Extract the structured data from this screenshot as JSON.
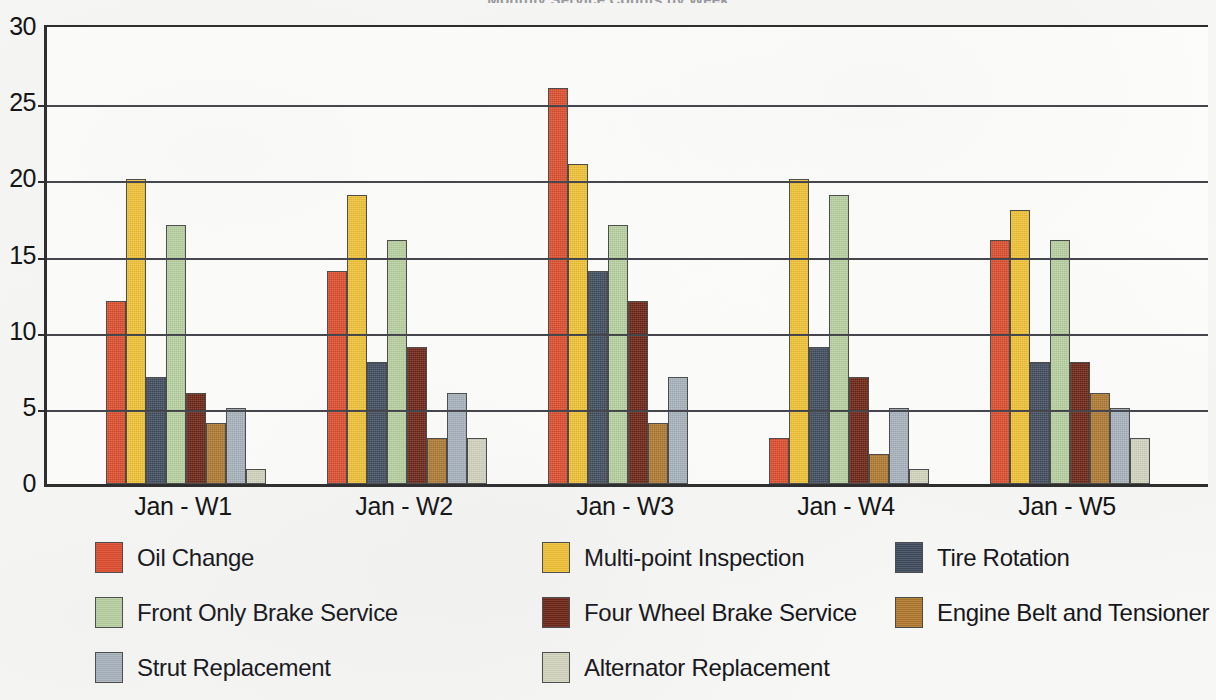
{
  "chart_data": {
    "type": "bar",
    "title": "Monthly Service Counts by Week",
    "xlabel": "",
    "ylabel": "",
    "ylim": [
      0,
      30
    ],
    "yticks": [
      0,
      5,
      10,
      15,
      20,
      25,
      30
    ],
    "grid": true,
    "legend_position": "bottom",
    "categories": [
      "Jan - W1",
      "Jan - W2",
      "Jan - W3",
      "Jan - W4",
      "Jan - W5"
    ],
    "series": [
      {
        "name": "Oil Change",
        "color": "#E04A28",
        "values": [
          12,
          14,
          26,
          3,
          16
        ]
      },
      {
        "name": "Multi-point Inspection",
        "color": "#F4C430",
        "values": [
          20,
          19,
          21,
          20,
          18
        ]
      },
      {
        "name": "Tire Rotation",
        "color": "#3D4A5C",
        "values": [
          7,
          8,
          14,
          9,
          8
        ]
      },
      {
        "name": "Front Only Brake Service",
        "color": "#B9D3A0",
        "values": [
          17,
          16,
          17,
          19,
          16
        ]
      },
      {
        "name": "Four Wheel Brake Service",
        "color": "#6B2010",
        "values": [
          6,
          9,
          12,
          7,
          8
        ]
      },
      {
        "name": "Engine Belt and Tensioner",
        "color": "#B0792C",
        "values": [
          4,
          3,
          4,
          2,
          6
        ]
      },
      {
        "name": "Strut Replacement",
        "color": "#A8B4BE",
        "values": [
          5,
          6,
          7,
          5,
          5
        ]
      },
      {
        "name": "Alternator Replacement",
        "color": "#D5D7C0",
        "values": [
          1,
          3,
          0,
          1,
          3
        ]
      }
    ]
  },
  "axis": {
    "y_tick_labels": [
      "30",
      "25",
      "20",
      "15",
      "10",
      "5",
      "0"
    ]
  },
  "legend": {
    "rows": [
      [
        {
          "label": "Oil Change",
          "color": "#E04A28"
        },
        {
          "label": "Multi-point Inspection",
          "color": "#F4C430"
        },
        {
          "label": "Tire Rotation",
          "color": "#3D4A5C"
        }
      ],
      [
        {
          "label": "Front Only Brake Service",
          "color": "#B9D3A0"
        },
        {
          "label": "Four Wheel Brake Service",
          "color": "#6B2010"
        },
        {
          "label": "Engine Belt and Tensioner",
          "color": "#B0792C"
        }
      ],
      [
        {
          "label": "Strut Replacement",
          "color": "#A8B4BE"
        },
        {
          "label": "Alternator Replacement",
          "color": "#D5D7C0"
        }
      ]
    ]
  }
}
